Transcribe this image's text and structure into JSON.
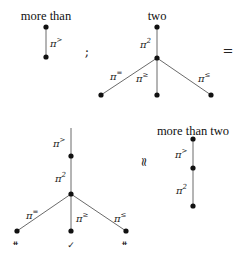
{
  "diagram": {
    "tree_more_than": {
      "root_label": "more than",
      "edges": [
        {
          "label": "π",
          "sup": ">"
        }
      ]
    },
    "separator_semicolon": ";",
    "tree_two": {
      "root_label": "two",
      "edges": [
        {
          "label": "π",
          "sup": "2"
        },
        {
          "label": "π",
          "sup": "="
        },
        {
          "label": "π",
          "sup": "≥"
        },
        {
          "label": "π",
          "sup": "≤"
        }
      ]
    },
    "equals": "=",
    "composed_tree": {
      "edges": [
        {
          "label": "π",
          "sup": ">"
        },
        {
          "label": "π",
          "sup": "2"
        },
        {
          "label": "π",
          "sup": "="
        },
        {
          "label": "π",
          "sup": "≥"
        },
        {
          "label": "π",
          "sup": "≤"
        }
      ],
      "leaf_marks": [
        "⧧",
        "✓",
        "⧧"
      ]
    },
    "approx": "≈",
    "tree_more_than_two": {
      "root_label": "more than two",
      "edges": [
        {
          "label": "π",
          "sup": ">"
        },
        {
          "label": "π",
          "sup": "2"
        }
      ]
    }
  }
}
